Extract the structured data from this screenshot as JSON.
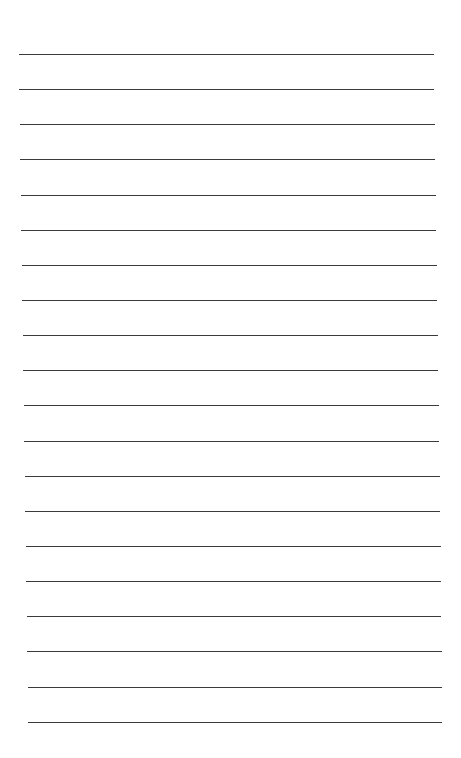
{
  "page": {
    "type": "lined-paper",
    "background": "#ffffff",
    "line_color": "#3a3a3a",
    "line_count": 20,
    "lines": [
      {
        "y": 54,
        "x1": 19,
        "x2": 434
      },
      {
        "y": 89,
        "x1": 19,
        "x2": 434
      },
      {
        "y": 124,
        "x1": 20,
        "x2": 435
      },
      {
        "y": 159,
        "x1": 20,
        "x2": 435
      },
      {
        "y": 195,
        "x1": 21,
        "x2": 436
      },
      {
        "y": 230,
        "x1": 21,
        "x2": 436
      },
      {
        "y": 265,
        "x1": 22,
        "x2": 437
      },
      {
        "y": 300,
        "x1": 22,
        "x2": 437
      },
      {
        "y": 335,
        "x1": 23,
        "x2": 438
      },
      {
        "y": 370,
        "x1": 23,
        "x2": 438
      },
      {
        "y": 405,
        "x1": 24,
        "x2": 439
      },
      {
        "y": 441,
        "x1": 24,
        "x2": 439
      },
      {
        "y": 476,
        "x1": 25,
        "x2": 440
      },
      {
        "y": 511,
        "x1": 25,
        "x2": 440
      },
      {
        "y": 546,
        "x1": 26,
        "x2": 441
      },
      {
        "y": 581,
        "x1": 26,
        "x2": 441
      },
      {
        "y": 616,
        "x1": 27,
        "x2": 441
      },
      {
        "y": 651,
        "x1": 27,
        "x2": 442
      },
      {
        "y": 687,
        "x1": 28,
        "x2": 442
      },
      {
        "y": 722,
        "x1": 28,
        "x2": 442
      }
    ]
  }
}
